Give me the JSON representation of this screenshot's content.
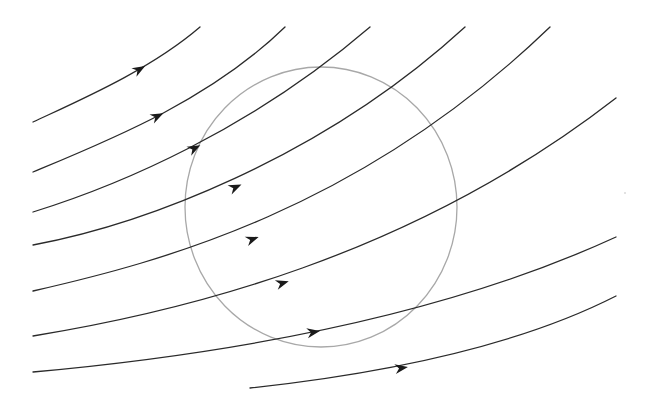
{
  "diagram": {
    "canvas": {
      "width": 653,
      "height": 416,
      "background": "#ffffff"
    },
    "colors": {
      "streamline": "#2a2a2a",
      "arrow": "#1a1a1a",
      "boundary": "#a8a8a8"
    },
    "boundary_circle": {
      "shape": "circle",
      "cx": 321,
      "cy": 207,
      "rx": 136,
      "ry": 140
    },
    "streamlines": [
      {
        "id": 1,
        "d": "M33,122 C80,100 150,70 200,27",
        "arrow": {
          "x": 140,
          "y": 69,
          "angle": -30
        }
      },
      {
        "id": 2,
        "d": "M33,172 C110,140 210,100 285,27",
        "arrow": {
          "x": 158,
          "y": 116,
          "angle": -26
        }
      },
      {
        "id": 3,
        "d": "M33,212 C120,185 250,130 370,27",
        "arrow": {
          "x": 195,
          "y": 148,
          "angle": -28
        }
      },
      {
        "id": 4,
        "d": "M33,245 C140,225 320,160 465,27",
        "arrow": {
          "x": 236,
          "y": 187,
          "angle": -24
        }
      },
      {
        "id": 5,
        "d": "M33,291 C160,262 360,210 550,27",
        "arrow": {
          "x": 253,
          "y": 239,
          "angle": -20
        }
      },
      {
        "id": 6,
        "d": "M33,336 C180,312 410,258 616,98",
        "arrow": {
          "x": 283,
          "y": 283,
          "angle": -17
        }
      },
      {
        "id": 7,
        "d": "M33,372 C220,355 440,318 616,237",
        "arrow": {
          "x": 314,
          "y": 332,
          "angle": -10
        }
      },
      {
        "id": 8,
        "d": "M250,388 C370,375 510,350 616,296",
        "arrow": {
          "x": 402,
          "y": 368,
          "angle": -9
        }
      }
    ],
    "speck": {
      "x": 625,
      "y": 193
    }
  }
}
